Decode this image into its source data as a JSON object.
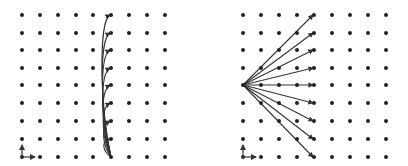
{
  "figure": {
    "panels": [
      {
        "id": "left",
        "description": "Curved trajectories from bottom point to each point in one column",
        "grid": {
          "cols_x": [
            22,
            40,
            58,
            76,
            93,
            111,
            129,
            147,
            165
          ],
          "rows_y": [
            15,
            33,
            50,
            68,
            85,
            103,
            121,
            139,
            157
          ]
        },
        "origin": {
          "x": 111,
          "y": 157
        },
        "target_col_index": 5,
        "path_type": "curve",
        "axes_corner": {
          "x": 22,
          "y": 157
        }
      },
      {
        "id": "right",
        "description": "Straight rays from a left-middle point fanning to each point in one column",
        "grid": {
          "cols_x": [
            243,
            261,
            279,
            297,
            314,
            332,
            350,
            368,
            386
          ],
          "rows_y": [
            15,
            33,
            50,
            68,
            85,
            103,
            121,
            139,
            157
          ]
        },
        "origin": {
          "x": 243,
          "y": 85
        },
        "target_col_index": 4,
        "path_type": "straight",
        "axes_corner": {
          "x": 243,
          "y": 157
        }
      }
    ],
    "colors": {
      "dot": "#222222",
      "line": "#333333",
      "background": "#ffffff"
    }
  }
}
